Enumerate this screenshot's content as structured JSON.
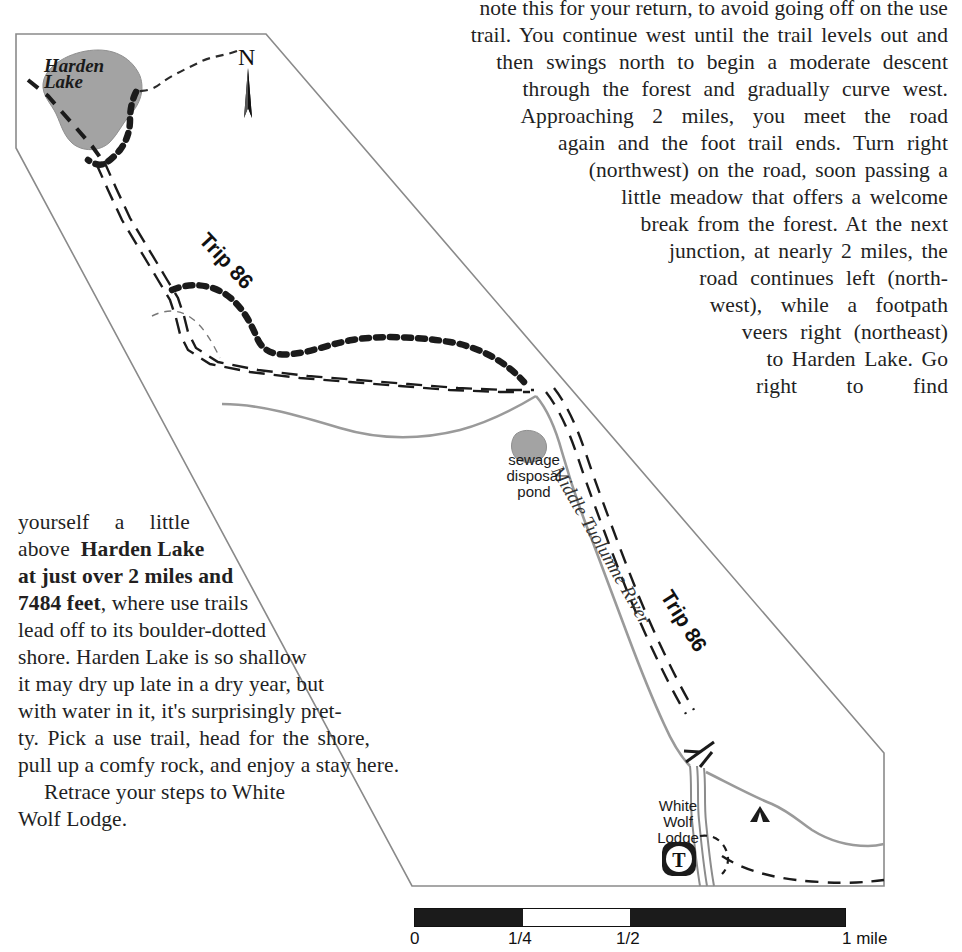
{
  "page": {
    "width": 962,
    "height": 952,
    "background": "#ffffff",
    "text_color": "#231f1f"
  },
  "body_text": {
    "top_clipped_line": "note this for your return, to avoid going off on the use",
    "right_column_lines": [
      "trail. You continue west until the trail levels out and",
      "then swings north to begin a moderate descent",
      "through the forest and gradually curve west.",
      "Approaching 2 miles, you meet the road",
      "again and the foot trail ends. Turn right",
      "(northwest) on the road, soon passing a",
      "little meadow that offers a welcome",
      "break from the forest. At the next",
      "junction, at nearly 2 miles, the",
      "road continues left (north-",
      "west), while a footpath",
      "veers right (northeast)",
      "to Harden Lake. Go",
      "right to find"
    ],
    "left_column_lines": [
      "yourself a little",
      "above Harden Lake",
      "at just over 2 miles and",
      "7484 feet, where use trails",
      "lead off to its boulder-dotted",
      "shore. Harden Lake is so shallow",
      "it may dry up late in a dry year, but",
      "with water in it, it's surprisingly pret-",
      "ty. Pick a use trail, head for the shore,",
      "pull up a comfy rock, and enjoy a stay here.",
      "Retrace your steps to White",
      "Wolf Lodge."
    ],
    "bold_fragments": [
      "Harden Lake",
      "at just over 2 miles and",
      "7484 feet"
    ]
  },
  "map": {
    "lake_label_line1": "Harden",
    "lake_label_line2": "Lake",
    "lake_fill": "#a3a3a3",
    "north_letter": "N",
    "north_arrow": "north-arrow-icon",
    "trip_label_upper": "Trip 86",
    "trip_label_lower": "Trip 86",
    "river_label": "Middle Tuolumne River",
    "pond_label_line1": "sewage",
    "pond_label_line2": "disposal",
    "pond_label_line3": "pond",
    "lodge_label_line1": "White",
    "lodge_label_line2": "Wolf",
    "lodge_label_line3": "Lodge",
    "trailhead_marker": "T",
    "campground_icon": "tent-icon",
    "bridge_icon": "bridge-crossing-icon",
    "border_color": "#8a8a8a",
    "road_color": "#9a9a9a",
    "trail_color": "#1b1b1b"
  },
  "scale_bar": {
    "segments": [
      {
        "kind": "dark",
        "fraction": 0.25
      },
      {
        "kind": "light",
        "fraction": 0.25
      },
      {
        "kind": "dark",
        "fraction": 0.5
      }
    ],
    "ticks": [
      {
        "label": "0",
        "position": 0.0
      },
      {
        "label": "1/4",
        "position": 0.25
      },
      {
        "label": "1/2",
        "position": 0.5
      },
      {
        "label": "1 mile",
        "position": 1.0
      }
    ],
    "bar_color_dark": "#1b1b1b",
    "bar_color_light": "#ffffff"
  }
}
